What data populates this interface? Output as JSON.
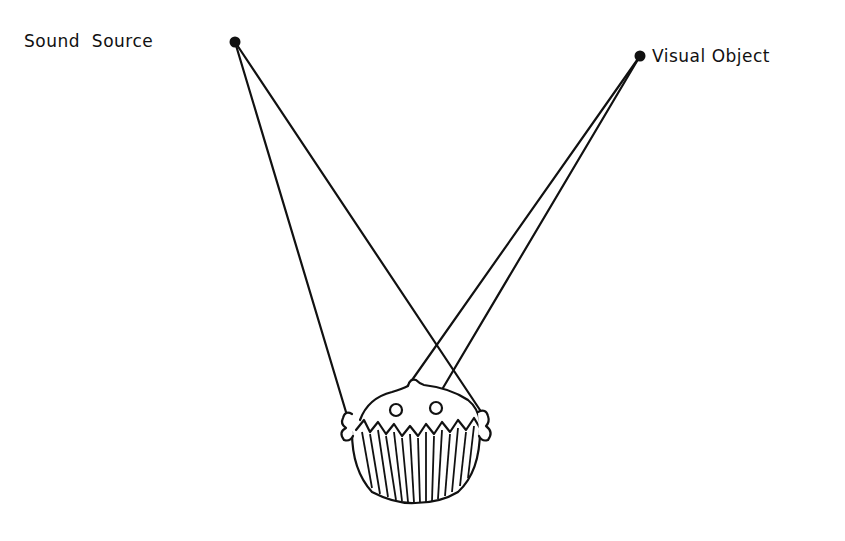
{
  "diagram": {
    "labels": {
      "sound_source": "Sound  Source",
      "visual_object": "Visual Object"
    },
    "nodes": {
      "sound_source": {
        "x": 235,
        "y": 42
      },
      "visual_object": {
        "x": 640,
        "y": 56
      }
    },
    "targets": {
      "left_ear": {
        "x": 346,
        "y": 412
      },
      "right_ear": {
        "x": 480,
        "y": 410
      },
      "left_eye": {
        "x": 398,
        "y": 406
      },
      "right_eye": {
        "x": 437,
        "y": 404
      }
    },
    "connections": [
      {
        "from": "sound_source",
        "to": "left_ear"
      },
      {
        "from": "sound_source",
        "to": "right_ear"
      },
      {
        "from": "visual_object",
        "to": "left_eye"
      },
      {
        "from": "visual_object",
        "to": "right_eye"
      }
    ],
    "colors": {
      "ink": "#111111",
      "background": "#ffffff"
    }
  }
}
